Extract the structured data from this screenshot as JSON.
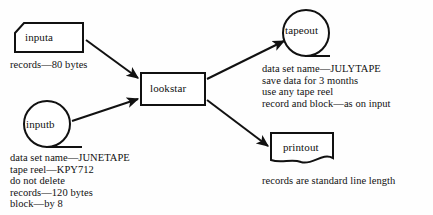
{
  "diagram": {
    "type": "data-flow-diagram",
    "background_color": "#fefefe",
    "stroke_color": "#111111",
    "nodes": [
      {
        "id": "inputa",
        "label": "inputa",
        "shape": "punched-card",
        "role": "input"
      },
      {
        "id": "inputb",
        "label": "inputb",
        "shape": "magnetic-tape-circle",
        "role": "input"
      },
      {
        "id": "lookstar",
        "label": "lookstar",
        "shape": "process-rectangle",
        "role": "process"
      },
      {
        "id": "tapeout",
        "label": "tapeout",
        "shape": "magnetic-tape-circle",
        "role": "output"
      },
      {
        "id": "printout",
        "label": "printout",
        "shape": "document",
        "role": "output"
      }
    ],
    "edges": [
      {
        "from": "inputa",
        "to": "lookstar"
      },
      {
        "from": "inputb",
        "to": "lookstar"
      },
      {
        "from": "lookstar",
        "to": "tapeout"
      },
      {
        "from": "lookstar",
        "to": "printout"
      }
    ],
    "captions": {
      "inputa": [
        "records—80 bytes"
      ],
      "inputb": [
        "data set name—JUNETAPE",
        "tape reel—KPY712",
        "do not delete",
        "records—120 bytes",
        "block—by 8"
      ],
      "tapeout": [
        "data set name—JULYTAPE",
        "save data for 3 months",
        "use any tape reel",
        "record and block—as on input"
      ],
      "printout": [
        "records are standard line length"
      ]
    }
  }
}
